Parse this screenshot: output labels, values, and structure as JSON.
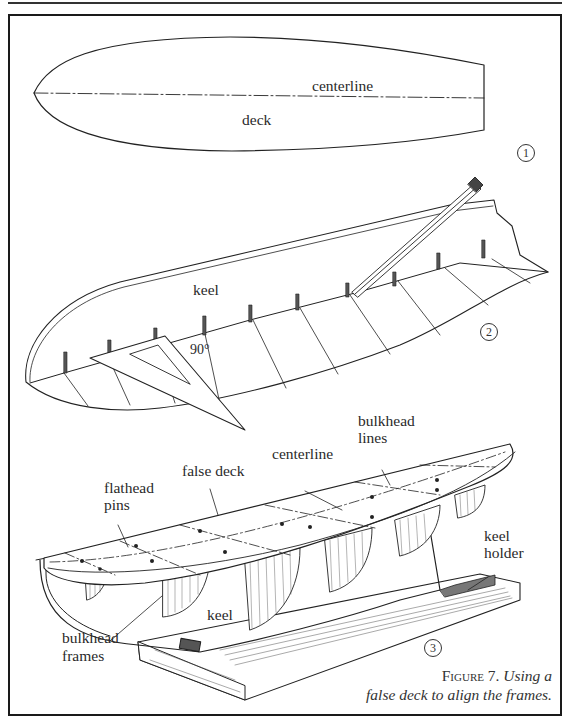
{
  "figure": {
    "number_label": "Figure 7.",
    "caption_line1": "Using a",
    "caption_line2": "false deck to align the frames."
  },
  "panel1": {
    "step": "1",
    "labels": {
      "centerline": "centerline",
      "deck": "deck"
    }
  },
  "panel2": {
    "step": "2",
    "labels": {
      "keel": "keel",
      "angle": "90°"
    }
  },
  "panel3": {
    "step": "3",
    "labels": {
      "flathead_pins_1": "flathead",
      "flathead_pins_2": "pins",
      "false_deck": "false deck",
      "centerline": "centerline",
      "bulkhead_lines_1": "bulkhead",
      "bulkhead_lines_2": "lines",
      "keel_holder_1": "keel",
      "keel_holder_2": "holder",
      "keel": "keel",
      "bulkhead_frames_1": "bulkhead",
      "bulkhead_frames_2": "frames"
    }
  },
  "colors": {
    "ink": "#222222",
    "paper": "#ffffff"
  }
}
